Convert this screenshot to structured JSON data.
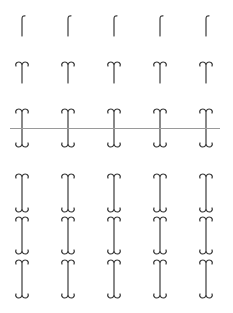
{
  "page": {
    "caption": "",
    "ink_color": "#3a3a3a",
    "rule_color": "#9a9a9a"
  },
  "glyph_specimen": {
    "columns_x": [
      22,
      68,
      114,
      160,
      206
    ],
    "rows": [
      {
        "name": "hook-top",
        "top": 15,
        "height": 21,
        "variant": "hook"
      },
      {
        "name": "double-curl-top",
        "top": 61,
        "height": 22,
        "variant": "top-curl"
      },
      {
        "name": "full-crossed",
        "top": 108,
        "height": 40,
        "variant": "full"
      },
      {
        "name": "full-1",
        "top": 173,
        "height": 40,
        "variant": "full"
      },
      {
        "name": "full-2",
        "top": 216,
        "height": 39,
        "variant": "full"
      },
      {
        "name": "full-3",
        "top": 259,
        "height": 40,
        "variant": "full"
      }
    ]
  }
}
